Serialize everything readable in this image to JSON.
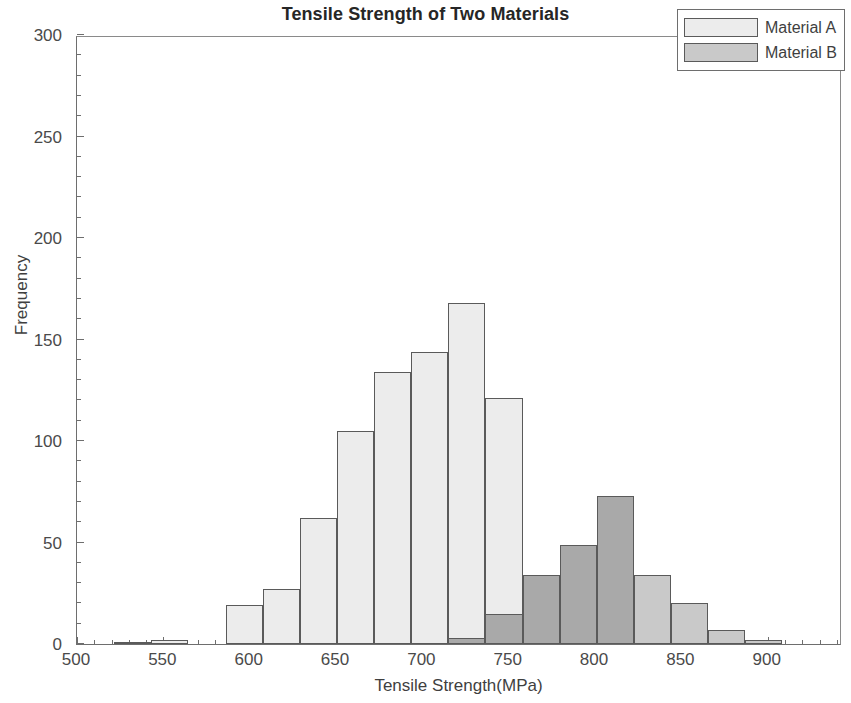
{
  "chart_data": {
    "type": "bar",
    "subtype": "histogram-overlay",
    "title": "Tensile Strength of Two Materials",
    "xlabel": "Tensile Strength(MPa)",
    "ylabel": "Frequency",
    "xlim": [
      500,
      943
    ],
    "ylim": [
      0,
      300
    ],
    "xticks": [
      500,
      550,
      600,
      650,
      700,
      750,
      800,
      850,
      900
    ],
    "yticks": [
      0,
      50,
      100,
      150,
      200,
      250,
      300
    ],
    "xtick_labels": [
      "500",
      "550",
      "600",
      "650",
      "700",
      "750",
      "800",
      "850",
      "900"
    ],
    "ytick_labels": [
      "0",
      "50",
      "100",
      "150",
      "200",
      "250",
      "300"
    ],
    "grid": false,
    "legend_position": "upper right",
    "bin_width": 21.5,
    "series": [
      {
        "name": "Material A",
        "color": "#ececec",
        "edge_color": "#5a5a5a",
        "bin_starts": [
          500.0,
          521.5,
          543.0,
          564.5,
          586.0,
          607.5,
          629.0,
          650.5,
          672.0,
          693.5,
          715.0,
          736.5,
          758.0,
          779.5,
          801.0
        ],
        "values": [
          0,
          1,
          2,
          0,
          19,
          27,
          62,
          105,
          134,
          144,
          168,
          121,
          34,
          4,
          1
        ]
      },
      {
        "name": "Material B",
        "color": "#c9c9c9",
        "edge_color": "#5a5a5a",
        "bin_starts": [
          693.5,
          715.0,
          736.5,
          758.0,
          779.5,
          801.0,
          822.5,
          844.0,
          865.5,
          887.0,
          908.5,
          930.0
        ],
        "values": [
          3,
          15,
          86,
          119,
          231,
          273,
          254,
          240,
          188,
          138,
          95,
          50
        ]
      }
    ],
    "bars": [
      {
        "series": "Material A",
        "x0": 521.5,
        "x1": 543.0,
        "value": 1
      },
      {
        "series": "Material A",
        "x0": 543.0,
        "x1": 564.5,
        "value": 2
      },
      {
        "series": "Material A",
        "x0": 586.0,
        "x1": 607.5,
        "value": 19
      },
      {
        "series": "Material A",
        "x0": 607.5,
        "x1": 629.0,
        "value": 27
      },
      {
        "series": "Material A",
        "x0": 629.0,
        "x1": 650.5,
        "value": 62
      },
      {
        "series": "Material A",
        "x0": 650.5,
        "x1": 672.0,
        "value": 105
      },
      {
        "series": "Material A",
        "x0": 672.0,
        "x1": 693.5,
        "value": 134
      },
      {
        "series": "Material A",
        "x0": 693.5,
        "x1": 715.0,
        "value": 144
      },
      {
        "series": "Material A",
        "x0": 715.0,
        "x1": 736.5,
        "value": 168
      },
      {
        "series": "Material A",
        "x0": 736.5,
        "x1": 758.0,
        "value": 121
      },
      {
        "series": "Material A",
        "x0": 758.0,
        "x1": 779.5,
        "value": 34
      },
      {
        "series": "Material A",
        "x0": 779.5,
        "x1": 801.0,
        "value": 4
      },
      {
        "series": "Material A",
        "x0": 801.0,
        "x1": 822.5,
        "value": 1
      },
      {
        "series": "Material B",
        "x0": 715.0,
        "x1": 736.5,
        "value": 3
      },
      {
        "series": "Material B",
        "x0": 736.5,
        "x1": 758.0,
        "value": 15
      },
      {
        "series": "Material B",
        "x0": 758.0,
        "x1": 779.5,
        "value": 34
      },
      {
        "series": "Material B",
        "x0": 779.5,
        "x1": 801.0,
        "value": 49
      },
      {
        "series": "Material B",
        "x0": 801.0,
        "x1": 822.5,
        "value": 73
      },
      {
        "series": "Material B",
        "x0": 822.5,
        "x1": 844.0,
        "value": 34
      },
      {
        "series": "Material B",
        "x0": 844.0,
        "x1": 865.5,
        "value": 20
      },
      {
        "series": "Material B",
        "x0": 865.5,
        "x1": 887.0,
        "value": 7
      },
      {
        "series": "Material B",
        "x0": 887.0,
        "x1": 908.5,
        "value": 2
      }
    ]
  },
  "legend": {
    "entries": [
      {
        "label": "Material A",
        "swatch": "sw-a"
      },
      {
        "label": "Material B",
        "swatch": "sw-b"
      }
    ]
  }
}
